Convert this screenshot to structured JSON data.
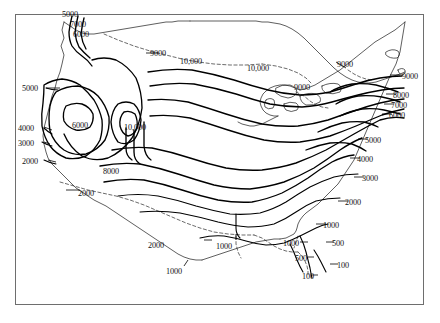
{
  "figure": {
    "type": "contour-map",
    "region": "contiguous United States",
    "frame": {
      "border_color": "#6e6e6e"
    },
    "line_color": "#000000",
    "background": "#ffffff"
  },
  "chart_data": {
    "type": "contour",
    "title": "",
    "xlabel": "",
    "ylabel": "",
    "grid": false,
    "legend": "none",
    "contour_interval_note": "",
    "contour_levels": [
      100,
      500,
      1000,
      2000,
      3000,
      4000,
      5000,
      6000,
      7000,
      8000,
      9000,
      10000
    ],
    "labels": [
      {
        "id": "l01",
        "text": "5000",
        "x": 62,
        "y": 11,
        "anchor": "left",
        "group": "northwest-crest"
      },
      {
        "id": "l02",
        "text": "7000",
        "x": 70,
        "y": 21,
        "anchor": "left",
        "group": "northwest-crest"
      },
      {
        "id": "l03",
        "text": "6000",
        "x": 73,
        "y": 31,
        "anchor": "left",
        "group": "northwest-crest"
      },
      {
        "id": "l04",
        "text": "9000",
        "x": 150,
        "y": 50,
        "anchor": "left",
        "group": "northern-tier"
      },
      {
        "id": "l05",
        "text": "10,000",
        "x": 180,
        "y": 58,
        "anchor": "left",
        "group": "northern-tier"
      },
      {
        "id": "l06",
        "text": "10,000",
        "x": 247,
        "y": 65,
        "anchor": "left",
        "group": "northern-tier"
      },
      {
        "id": "l07",
        "text": "9000",
        "x": 294,
        "y": 84,
        "anchor": "left",
        "group": "great-lakes"
      },
      {
        "id": "l08",
        "text": "9000",
        "x": 337,
        "y": 61,
        "anchor": "left",
        "group": "northeast"
      },
      {
        "id": "l09",
        "text": "9000",
        "x": 402,
        "y": 73,
        "anchor": "left",
        "group": "east-coast"
      },
      {
        "id": "l10",
        "text": "8000",
        "x": 393,
        "y": 92,
        "anchor": "left",
        "group": "east-coast"
      },
      {
        "id": "l11",
        "text": "7000",
        "x": 391,
        "y": 102,
        "anchor": "left",
        "group": "east-coast"
      },
      {
        "id": "l12",
        "text": "6000",
        "x": 389,
        "y": 112,
        "anchor": "left",
        "group": "east-coast"
      },
      {
        "id": "l13",
        "text": "5000",
        "x": 365,
        "y": 137,
        "anchor": "left",
        "group": "east-coast"
      },
      {
        "id": "l14",
        "text": "4000",
        "x": 357,
        "y": 156,
        "anchor": "left",
        "group": "east-coast"
      },
      {
        "id": "l15",
        "text": "3000",
        "x": 362,
        "y": 175,
        "anchor": "left",
        "group": "east-coast"
      },
      {
        "id": "l16",
        "text": "2000",
        "x": 345,
        "y": 199,
        "anchor": "left",
        "group": "southeast"
      },
      {
        "id": "l17",
        "text": "1000",
        "x": 323,
        "y": 222,
        "anchor": "left",
        "group": "southeast"
      },
      {
        "id": "l18",
        "text": "1000",
        "x": 283,
        "y": 240,
        "anchor": "left",
        "group": "gulf-coast"
      },
      {
        "id": "l19",
        "text": "500",
        "x": 332,
        "y": 240,
        "anchor": "left",
        "group": "southeast"
      },
      {
        "id": "l20",
        "text": "500",
        "x": 295,
        "y": 255,
        "anchor": "left",
        "group": "florida"
      },
      {
        "id": "l21",
        "text": "100",
        "x": 337,
        "y": 262,
        "anchor": "left",
        "group": "florida"
      },
      {
        "id": "l22",
        "text": "100",
        "x": 302,
        "y": 273,
        "anchor": "left",
        "group": "florida"
      },
      {
        "id": "l23",
        "text": "5000",
        "x": 22,
        "y": 85,
        "anchor": "left",
        "group": "west-coast"
      },
      {
        "id": "l24",
        "text": "4000",
        "x": 18,
        "y": 125,
        "anchor": "left",
        "group": "west-coast"
      },
      {
        "id": "l25",
        "text": "3000",
        "x": 18,
        "y": 140,
        "anchor": "left",
        "group": "west-coast"
      },
      {
        "id": "l26",
        "text": "2000",
        "x": 22,
        "y": 158,
        "anchor": "left",
        "group": "west-coast"
      },
      {
        "id": "l27",
        "text": "6000",
        "x": 72,
        "y": 122,
        "anchor": "left",
        "group": "great-basin"
      },
      {
        "id": "l28",
        "text": "10,000",
        "x": 124,
        "y": 124,
        "anchor": "left",
        "group": "rockies"
      },
      {
        "id": "l29",
        "text": "8000",
        "x": 103,
        "y": 168,
        "anchor": "left",
        "group": "rockies"
      },
      {
        "id": "l30",
        "text": "2000",
        "x": 78,
        "y": 190,
        "anchor": "left",
        "group": "southwest"
      },
      {
        "id": "l31",
        "text": "2000",
        "x": 148,
        "y": 242,
        "anchor": "left",
        "group": "texas"
      },
      {
        "id": "l32",
        "text": "1000",
        "x": 166,
        "y": 268,
        "anchor": "left",
        "group": "texas"
      },
      {
        "id": "l33",
        "text": "1000",
        "x": 216,
        "y": 243,
        "anchor": "left",
        "group": "gulf-coast"
      }
    ]
  }
}
